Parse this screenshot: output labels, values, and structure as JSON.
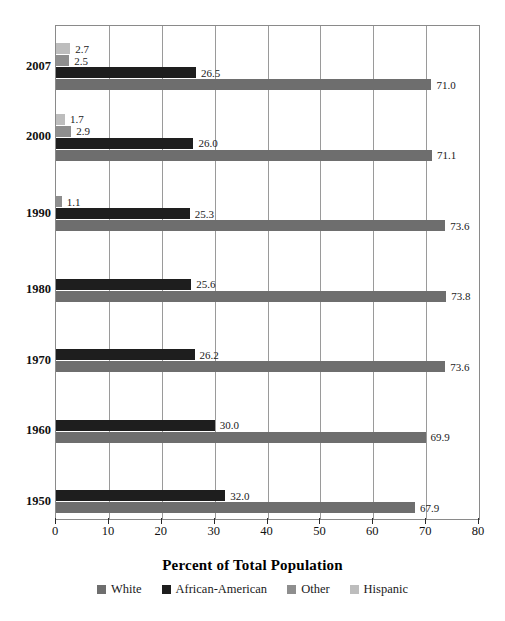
{
  "chart_data": {
    "type": "bar",
    "orientation": "horizontal",
    "title": "",
    "xlabel": "Percent of Total Population",
    "ylabel": "",
    "xlim": [
      0,
      80
    ],
    "xticks": [
      0,
      10,
      20,
      30,
      40,
      50,
      60,
      70,
      80
    ],
    "xtick_labels": [
      "0",
      "10",
      "20",
      "30",
      "40",
      "50",
      "60",
      "70",
      "80"
    ],
    "grid": "vertical",
    "legend_position": "bottom",
    "categories": [
      "2007",
      "2000",
      "1990",
      "1980",
      "1970",
      "1960",
      "1950"
    ],
    "series": [
      {
        "name": "White",
        "color": "#6e6e6e",
        "values": [
          71.0,
          71.1,
          73.6,
          73.8,
          73.6,
          69.9,
          67.9
        ]
      },
      {
        "name": "African-American",
        "color": "#1e1e1e",
        "values": [
          26.5,
          26.0,
          25.3,
          25.6,
          26.2,
          30.0,
          32.0
        ]
      },
      {
        "name": "Other",
        "color": "#8e8e8e",
        "values": [
          2.5,
          2.9,
          1.1,
          null,
          null,
          null,
          null
        ]
      },
      {
        "name": "Hispanic",
        "color": "#bdbdbd",
        "values": [
          2.7,
          1.7,
          null,
          null,
          null,
          null,
          null
        ]
      }
    ],
    "groups": [
      {
        "year": "2007",
        "bars": [
          {
            "series": "Hispanic",
            "value": 2.7,
            "label": "2.7",
            "color": "#bdbdbd"
          },
          {
            "series": "Other",
            "value": 2.5,
            "label": "2.5",
            "color": "#8e8e8e"
          },
          {
            "series": "African-American",
            "value": 26.5,
            "label": "26.5",
            "color": "#1e1e1e"
          },
          {
            "series": "White",
            "value": 71.0,
            "label": "71.0",
            "color": "#6e6e6e"
          }
        ]
      },
      {
        "year": "2000",
        "bars": [
          {
            "series": "Hispanic",
            "value": 1.7,
            "label": "1.7",
            "color": "#bdbdbd"
          },
          {
            "series": "Other",
            "value": 2.9,
            "label": "2.9",
            "color": "#8e8e8e"
          },
          {
            "series": "African-American",
            "value": 26.0,
            "label": "26.0",
            "color": "#1e1e1e"
          },
          {
            "series": "White",
            "value": 71.1,
            "label": "71.1",
            "color": "#6e6e6e"
          }
        ]
      },
      {
        "year": "1990",
        "bars": [
          {
            "series": "Other",
            "value": 1.1,
            "label": "1.1",
            "color": "#8e8e8e"
          },
          {
            "series": "African-American",
            "value": 25.3,
            "label": "25.3",
            "color": "#1e1e1e"
          },
          {
            "series": "White",
            "value": 73.6,
            "label": "73.6",
            "color": "#6e6e6e"
          }
        ]
      },
      {
        "year": "1980",
        "bars": [
          {
            "series": "African-American",
            "value": 25.6,
            "label": "25.6",
            "color": "#1e1e1e"
          },
          {
            "series": "White",
            "value": 73.8,
            "label": "73.8",
            "color": "#6e6e6e"
          }
        ]
      },
      {
        "year": "1970",
        "bars": [
          {
            "series": "African-American",
            "value": 26.2,
            "label": "26.2",
            "color": "#1e1e1e"
          },
          {
            "series": "White",
            "value": 73.6,
            "label": "73.6",
            "color": "#6e6e6e"
          }
        ]
      },
      {
        "year": "1960",
        "bars": [
          {
            "series": "African-American",
            "value": 30.0,
            "label": "30.0",
            "color": "#1e1e1e"
          },
          {
            "series": "White",
            "value": 69.9,
            "label": "69.9",
            "color": "#6e6e6e"
          }
        ]
      },
      {
        "year": "1950",
        "bars": [
          {
            "series": "African-American",
            "value": 32.0,
            "label": "32.0",
            "color": "#1e1e1e"
          },
          {
            "series": "White",
            "value": 67.9,
            "label": "67.9",
            "color": "#6e6e6e"
          }
        ]
      }
    ]
  },
  "legend": {
    "items": [
      {
        "label": "White",
        "color": "#6e6e6e"
      },
      {
        "label": "African-American",
        "color": "#1e1e1e"
      },
      {
        "label": "Other",
        "color": "#8e8e8e"
      },
      {
        "label": "Hispanic",
        "color": "#bdbdbd"
      }
    ]
  },
  "axis": {
    "title": "Percent of Total Population"
  },
  "style": {
    "grid_color": "#9a9a9a",
    "frame_color": "#8a8a8a",
    "text_color": "#1a1a1a"
  }
}
